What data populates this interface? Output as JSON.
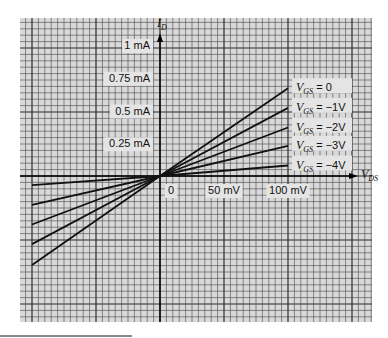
{
  "chart_data": {
    "type": "line",
    "title": "",
    "xlabel": "V_DS",
    "ylabel": "I_D",
    "x_unit": "mV",
    "y_unit": "mA",
    "xlim": [
      -125,
      165
    ],
    "ylim": [
      -1.1,
      1.2
    ],
    "grid": true,
    "x_tick_labels": [
      "0",
      "50 mV",
      "100 mV"
    ],
    "x_ticks": [
      0,
      50,
      100
    ],
    "y_tick_labels": [
      "1 mA",
      "0.75 mA",
      "0.5 mA",
      "0.25 mA"
    ],
    "y_ticks": [
      1,
      0.75,
      0.5,
      0.25
    ],
    "x": [
      -100,
      0,
      100
    ],
    "series": [
      {
        "name": "V_GS = 0",
        "label_main": "V",
        "label_sub": "GS",
        "label_tail": " = 0",
        "values": [
          -0.68,
          0,
          0.67
        ]
      },
      {
        "name": "V_GS = -1V",
        "label_main": "V",
        "label_sub": "GS",
        "label_tail": " = −1V",
        "values": [
          -0.52,
          0,
          0.52
        ]
      },
      {
        "name": "V_GS = -2V",
        "label_main": "V",
        "label_sub": "GS",
        "label_tail": " = −2V",
        "values": [
          -0.37,
          0,
          0.37
        ]
      },
      {
        "name": "V_GS = -3V",
        "label_main": "V",
        "label_sub": "GS",
        "label_tail": " = −3V",
        "values": [
          -0.22,
          0,
          0.23
        ]
      },
      {
        "name": "V_GS = -4V",
        "label_main": "V",
        "label_sub": "GS",
        "label_tail": " = −4V",
        "values": [
          -0.07,
          0,
          0.08
        ]
      }
    ],
    "legend_position": "inline-right"
  },
  "axes": {
    "x_label_main": "V",
    "x_label_sub": "DS",
    "y_label_main": "I",
    "y_label_sub": "D"
  },
  "colors": {
    "grid_bg": "#d9d9d9",
    "grid_minor": "#5a5a5a",
    "grid_major": "#2a2a2a",
    "line": "#111111",
    "label_bg": "#e4e4e4"
  }
}
